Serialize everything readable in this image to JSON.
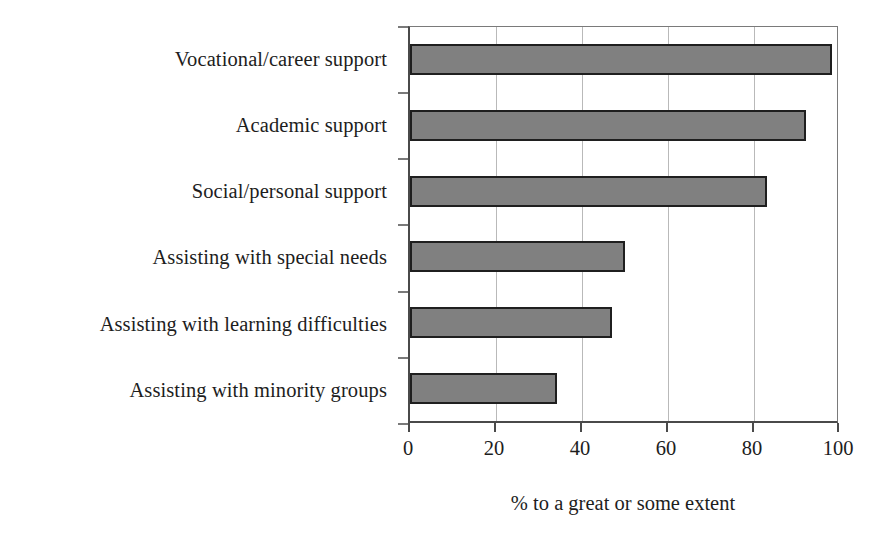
{
  "chart_data": {
    "type": "bar",
    "orientation": "horizontal",
    "title": "",
    "xlabel": "% to a great or some extent",
    "ylabel": "",
    "categories": [
      "Vocational/career support",
      "Academic support",
      "Social/personal support",
      "Assisting with special needs",
      "Assisting with learning difficulties",
      "Assisting with minority groups"
    ],
    "values": [
      99,
      93,
      84,
      51,
      48,
      35
    ],
    "xlim": [
      0,
      100
    ],
    "xticks": [
      0,
      20,
      40,
      60,
      80,
      100
    ],
    "xtick_labels": [
      "0",
      "20",
      "40",
      "60",
      "80",
      "100"
    ],
    "grid": true,
    "grid_axis": "x",
    "legend": null,
    "bar_fill_color": "#808080",
    "bar_border_color": "#1f1f1f",
    "axis_color": "#4a4a4a",
    "gridline_color": "#b9b9b9",
    "background_color": "#ffffff"
  }
}
